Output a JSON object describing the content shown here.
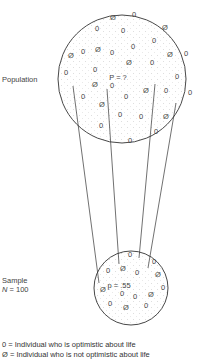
{
  "population": {
    "label": "Population",
    "parameter": "P = ?",
    "circle": {
      "cx": 122,
      "cy": 79,
      "r": 64
    },
    "symbols": [
      {
        "t": "Ø",
        "x": 113,
        "y": 20
      },
      {
        "t": "0",
        "x": 134,
        "y": 17
      },
      {
        "t": "0",
        "x": 97,
        "y": 31
      },
      {
        "t": "0",
        "x": 123,
        "y": 33
      },
      {
        "t": "Ø",
        "x": 165,
        "y": 30
      },
      {
        "t": "0",
        "x": 154,
        "y": 43
      },
      {
        "t": "0",
        "x": 133,
        "y": 49
      },
      {
        "t": "Ø",
        "x": 98,
        "y": 52
      },
      {
        "t": "Ø",
        "x": 71,
        "y": 58
      },
      {
        "t": "0",
        "x": 83,
        "y": 54
      },
      {
        "t": "0",
        "x": 112,
        "y": 55
      },
      {
        "t": "Ø",
        "x": 170,
        "y": 57
      },
      {
        "t": "0",
        "x": 186,
        "y": 56
      },
      {
        "t": "Ø",
        "x": 129,
        "y": 65
      },
      {
        "t": "0",
        "x": 152,
        "y": 65
      },
      {
        "t": "0",
        "x": 95,
        "y": 72
      },
      {
        "t": "0",
        "x": 66,
        "y": 75
      },
      {
        "t": "0",
        "x": 177,
        "y": 79
      },
      {
        "t": "Ø",
        "x": 95,
        "y": 87
      },
      {
        "t": "0",
        "x": 112,
        "y": 88
      },
      {
        "t": "Ø",
        "x": 146,
        "y": 93
      },
      {
        "t": "0",
        "x": 166,
        "y": 93
      },
      {
        "t": "0",
        "x": 190,
        "y": 95
      },
      {
        "t": "0",
        "x": 83,
        "y": 99
      },
      {
        "t": "0",
        "x": 126,
        "y": 99
      },
      {
        "t": "Ø",
        "x": 102,
        "y": 107
      },
      {
        "t": "0",
        "x": 120,
        "y": 117
      },
      {
        "t": "0",
        "x": 141,
        "y": 119
      },
      {
        "t": "Ø",
        "x": 166,
        "y": 119
      },
      {
        "t": "0",
        "x": 101,
        "y": 128
      },
      {
        "t": "0",
        "x": 156,
        "y": 134
      },
      {
        "t": "0",
        "x": 130,
        "y": 143
      }
    ],
    "parameter_pos": {
      "x": 118,
      "y": 80
    }
  },
  "sample": {
    "label_line1": "Sample",
    "label_line2_var": "N",
    "label_line2_rest": " = 100",
    "statistic": "p = .55",
    "circle": {
      "cx": 131,
      "cy": 288,
      "r": 37
    },
    "symbols": [
      {
        "t": "0",
        "x": 130,
        "y": 257
      },
      {
        "t": "0",
        "x": 154,
        "y": 264
      },
      {
        "t": "0",
        "x": 108,
        "y": 273
      },
      {
        "t": "Ø",
        "x": 123,
        "y": 271
      },
      {
        "t": "0",
        "x": 137,
        "y": 275
      },
      {
        "t": "Ø",
        "x": 158,
        "y": 277
      },
      {
        "t": "0",
        "x": 163,
        "y": 290
      },
      {
        "t": "Ø",
        "x": 103,
        "y": 292
      },
      {
        "t": "0",
        "x": 122,
        "y": 296
      },
      {
        "t": "0",
        "x": 135,
        "y": 299
      },
      {
        "t": "Ø",
        "x": 151,
        "y": 297
      },
      {
        "t": "0",
        "x": 110,
        "y": 306
      },
      {
        "t": "Ø",
        "x": 126,
        "y": 310
      },
      {
        "t": "0",
        "x": 146,
        "y": 308
      }
    ],
    "statistic_pos": {
      "x": 119,
      "y": 288
    }
  },
  "connectors": [
    {
      "x1": 73,
      "y1": 86,
      "x2": 99,
      "y2": 283
    },
    {
      "x1": 107,
      "y1": 89,
      "x2": 119,
      "y2": 264
    },
    {
      "x1": 155,
      "y1": 84,
      "x2": 139,
      "y2": 258
    },
    {
      "x1": 176,
      "y1": 103,
      "x2": 148,
      "y2": 268
    }
  ],
  "legend": {
    "line1": "0 = Individual who is optimistic about life",
    "line2": "Ø = Individual who is not optimistic about life"
  },
  "colors": {
    "stroke": "#333333",
    "text": "#444444",
    "dots": "#bbbbbb"
  }
}
